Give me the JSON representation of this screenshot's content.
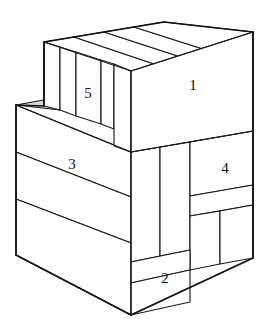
{
  "figure": {
    "type": "isometric-block-diagram",
    "background_color": "#ffffff",
    "line_color": "#1a1a1a",
    "shaded_color": "#d8d8d8",
    "label_color": "#111111",
    "part_count": 5
  },
  "labels": [
    {
      "id": "part-1",
      "text": "1",
      "x": 193,
      "y": 87,
      "face": "upper-block-front-right"
    },
    {
      "id": "part-2",
      "text": "2",
      "x": 165,
      "y": 280,
      "face": "lower-block-front-right-bottom"
    },
    {
      "id": "part-3",
      "text": "3",
      "x": 72,
      "y": 166,
      "face": "lower-block-front-left-top"
    },
    {
      "id": "part-4",
      "text": "4",
      "x": 225,
      "y": 170,
      "face": "lower-block-right-upper"
    },
    {
      "id": "part-5",
      "text": "5",
      "x": 88,
      "y": 95,
      "face": "upper-block-left-slab"
    }
  ],
  "parts": [
    {
      "number": "1",
      "name": "upper-block-front-face",
      "description": "large front-right face of the top block"
    },
    {
      "number": "2",
      "name": "lower-block-bottom-front-face",
      "description": "small face at bottom front of the lower block"
    },
    {
      "number": "3",
      "name": "lower-block-left-front-face",
      "description": "wide left-front face of the lower block"
    },
    {
      "number": "4",
      "name": "lower-block-right-face",
      "description": "right-side face of the lower block, upper band"
    },
    {
      "number": "5",
      "name": "upper-block-side-slab",
      "description": "narrow slab on the left end of the top block"
    }
  ],
  "geometry": {
    "upper_block": {
      "top_back_left": [
        44,
        42
      ],
      "top_back_right": [
        253,
        32
      ],
      "top_front_left": [
        131,
        71
      ],
      "top_front_right": [
        253,
        32
      ],
      "front_bottom_left": [
        131,
        152
      ],
      "front_bottom_right": [
        253,
        131
      ],
      "slab_divisions_on_top": 3
    },
    "lower_block": {
      "top_left": [
        16,
        105
      ],
      "front_top": [
        131,
        152
      ],
      "bottom_left": [
        16,
        255
      ],
      "bottom_front": [
        131,
        315
      ],
      "bottom_right": [
        253,
        258
      ],
      "left_face_bands": 3,
      "right_face_bands": 3
    },
    "shaded_triangle": {
      "points": [
        [
          16,
          105
        ],
        [
          60,
          98
        ],
        [
          60,
          110
        ]
      ],
      "note": "small grey wedge at upper-left step"
    }
  }
}
